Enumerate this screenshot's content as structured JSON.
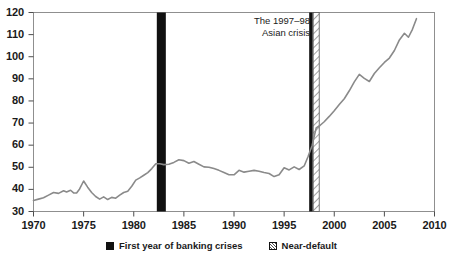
{
  "chart_data": {
    "type": "line",
    "title": "",
    "subtitle": "",
    "xlabel": "",
    "ylabel": "",
    "xlim": [
      1970,
      2010
    ],
    "ylim": [
      30,
      120
    ],
    "grid": false,
    "legend_position": "bottom-center",
    "x_ticks": [
      1970,
      1975,
      1980,
      1985,
      1990,
      1995,
      2000,
      2005,
      2010
    ],
    "x_tick_labels": [
      "1970",
      "1975",
      "1980",
      "1985",
      "1990",
      "1995",
      "2000",
      "2005",
      "2010"
    ],
    "y_ticks": [
      30,
      40,
      50,
      60,
      70,
      80,
      90,
      100,
      110,
      120
    ],
    "y_tick_labels": [
      "30",
      "40",
      "50",
      "60",
      "70",
      "80",
      "90",
      "100",
      "110",
      "120"
    ],
    "series": [
      {
        "name": "index",
        "color": "#8a8a8a",
        "x": [
          1970.0,
          1970.5,
          1971.0,
          1971.5,
          1972.0,
          1972.5,
          1973.0,
          1973.3,
          1973.7,
          1974.0,
          1974.3,
          1974.6,
          1975.0,
          1975.4,
          1975.8,
          1976.2,
          1976.6,
          1977.0,
          1977.4,
          1977.8,
          1978.2,
          1978.6,
          1979.0,
          1979.4,
          1979.8,
          1980.2,
          1980.6,
          1981.0,
          1981.4,
          1981.8,
          1982.2,
          1982.6,
          1983.0,
          1983.5,
          1984.0,
          1984.5,
          1985.0,
          1985.5,
          1986.0,
          1986.5,
          1987.0,
          1987.5,
          1988.0,
          1988.5,
          1989.0,
          1989.5,
          1990.0,
          1990.5,
          1991.0,
          1991.5,
          1992.0,
          1992.5,
          1993.0,
          1993.5,
          1994.0,
          1994.5,
          1995.0,
          1995.5,
          1996.0,
          1996.5,
          1997.0,
          1997.4,
          1997.8,
          1998.2,
          1998.6,
          1999.0,
          1999.5,
          2000.0,
          2000.5,
          2001.0,
          2001.5,
          2002.0,
          2002.5,
          2003.0,
          2003.5,
          2004.0,
          2004.5,
          2005.0,
          2005.5,
          2006.0,
          2006.5,
          2007.0,
          2007.4,
          2007.8,
          2008.2
        ],
        "y": [
          35.0,
          35.6,
          36.2,
          37.4,
          38.6,
          38.2,
          39.4,
          38.8,
          39.6,
          38.4,
          38.4,
          40.2,
          43.8,
          41.0,
          38.6,
          36.8,
          35.6,
          36.6,
          35.4,
          36.4,
          36.0,
          37.4,
          38.6,
          39.2,
          41.4,
          44.2,
          45.2,
          46.4,
          47.6,
          49.4,
          51.6,
          51.6,
          51.2,
          51.4,
          52.2,
          53.4,
          53.0,
          51.8,
          52.6,
          51.4,
          50.2,
          50.0,
          49.4,
          48.6,
          47.6,
          46.6,
          46.6,
          48.6,
          47.8,
          48.2,
          48.6,
          48.2,
          47.6,
          47.2,
          45.8,
          46.6,
          49.8,
          48.8,
          50.2,
          49.0,
          50.6,
          55.0,
          60.0,
          67.8,
          69.0,
          70.6,
          73.0,
          75.6,
          78.4,
          81.0,
          84.6,
          88.6,
          92.0,
          90.2,
          88.8,
          92.4,
          95.0,
          97.4,
          99.4,
          102.8,
          107.6,
          110.6,
          108.8,
          112.4,
          117.2
        ]
      }
    ],
    "event_bands": [
      {
        "name": "first-year-of-banking-crises",
        "style": "solid",
        "color": "#111111",
        "x_start": 1982.3,
        "x_end": 1983.2
      },
      {
        "name": "first-year-of-banking-crises",
        "style": "solid",
        "color": "#111111",
        "x_start": 1997.5,
        "x_end": 1997.85
      },
      {
        "name": "near-default",
        "style": "hatched",
        "color": "#555555",
        "x_start": 1997.9,
        "x_end": 1998.5
      }
    ],
    "annotations": [
      {
        "name": "asian-crisis-annotation",
        "line1": "The 1997–98",
        "line2": "Asian crisis"
      }
    ],
    "legend": [
      {
        "marker": "solid-square",
        "label": "First year of banking crises"
      },
      {
        "marker": "hatched-square",
        "label": "Near-default"
      }
    ]
  }
}
